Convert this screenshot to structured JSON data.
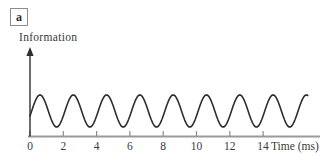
{
  "panel_label": "a",
  "colors": {
    "background": "#ffffff",
    "wave": "#2e2e2e",
    "y_axis": "#2e2e2e",
    "x_axis": "#999999",
    "tick": "#8c8c8c",
    "text": "#3a3a3a",
    "panel_border": "#8c8c8c"
  },
  "chart_data": {
    "type": "line",
    "title": "",
    "xlabel": "Time (ms)",
    "ylabel": "Information",
    "x_ticks": [
      0,
      2,
      4,
      6,
      8,
      10,
      12,
      14
    ],
    "xlim": [
      0,
      17.4
    ],
    "grid": false,
    "legend": false,
    "series": [
      {
        "name": "information-signal",
        "shape": "sine",
        "period_ms": 2,
        "amplitude": 1,
        "first_peak_t_ms": 0.6,
        "t_start_ms": 0,
        "t_end_ms": 16.7,
        "cycles_visible": 8.35
      }
    ]
  }
}
